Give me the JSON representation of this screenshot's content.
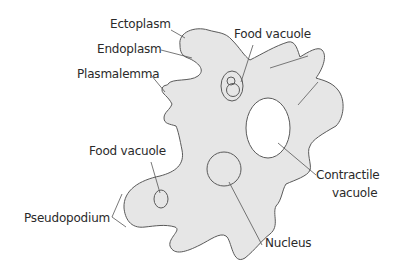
{
  "diagram": {
    "colors": {
      "cytoplasm_fill": "#e6e6e6",
      "outline": "#5a5a5a",
      "leader_line": "#555555",
      "text": "#2a2a2a",
      "vacuole_fill": "#ffffff"
    },
    "labels": {
      "ectoplasm": "Ectoplasm",
      "endoplasm": "Endoplasm",
      "plasmalemma": "Plasmalemma",
      "food_vacuole_top": "Food vacuole",
      "food_vacuole_left": "Food vacuole",
      "pseudopodium": "Pseudopodium",
      "contractile_vacuole_line1": "Contractile",
      "contractile_vacuole_line2": "vacuole",
      "nucleus": "Nucleus"
    }
  }
}
